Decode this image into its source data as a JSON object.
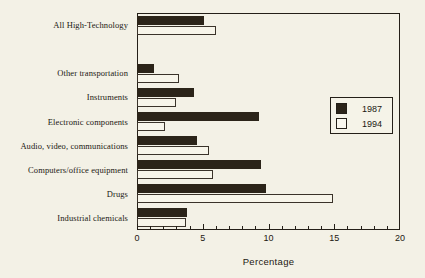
{
  "chart_data": {
    "type": "bar",
    "orientation": "horizontal",
    "title": "",
    "xlabel": "Percentage",
    "ylabel": "",
    "xlim": [
      0,
      20
    ],
    "xticks": [
      0,
      5,
      10,
      15,
      20
    ],
    "xtick_labels": [
      "0",
      "5",
      "10",
      "15",
      "20"
    ],
    "minor_ticks": [
      1,
      2,
      3,
      4,
      6,
      7,
      8,
      9,
      11,
      12,
      13,
      14,
      16,
      17,
      18,
      19
    ],
    "grid": false,
    "legend_position": "right-upper",
    "categories": [
      "All High-Technology",
      "",
      "Other transportation",
      "Instruments",
      "Electronic components",
      "Audio, video, communications",
      "Computers/office equipment",
      "Drugs",
      "Industrial chemicals"
    ],
    "series": [
      {
        "name": "1987",
        "color": "#2b2419",
        "values": [
          5.1,
          null,
          1.3,
          4.3,
          9.3,
          4.6,
          9.4,
          9.8,
          3.8
        ]
      },
      {
        "name": "1994",
        "color": "#f7f5ea",
        "values": [
          6.0,
          null,
          3.2,
          3.0,
          2.1,
          5.5,
          5.8,
          14.9,
          3.7
        ]
      }
    ]
  },
  "legend": {
    "entries": [
      {
        "label": "1987",
        "swatch": "filled"
      },
      {
        "label": "1994",
        "swatch": "hollow"
      }
    ]
  },
  "axis": {
    "x_title": "Percentage"
  }
}
